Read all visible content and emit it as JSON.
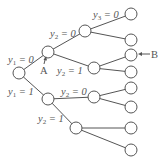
{
  "diagram": {
    "type": "binary-tree",
    "labels": {
      "y1_0": {
        "var": "y",
        "sub": "1",
        "rest": " = 0"
      },
      "y1_1": {
        "var": "y",
        "sub": "1",
        "rest": " = 1"
      },
      "y2_0_top": {
        "var": "y",
        "sub": "2",
        "rest": " = 0"
      },
      "y2_1_top": {
        "var": "y",
        "sub": "2",
        "rest": " = 1"
      },
      "y2_0_bot": {
        "var": "y",
        "sub": "2",
        "rest": " = 0"
      },
      "y2_1_bot": {
        "var": "y",
        "sub": "2",
        "rest": " = 1"
      },
      "y3_0": {
        "var": "y",
        "sub": "3",
        "rest": " = 0"
      }
    },
    "markers": {
      "A": "A",
      "B": "B"
    },
    "colors": {
      "stroke": "#555555",
      "background": "#ffffff"
    }
  }
}
